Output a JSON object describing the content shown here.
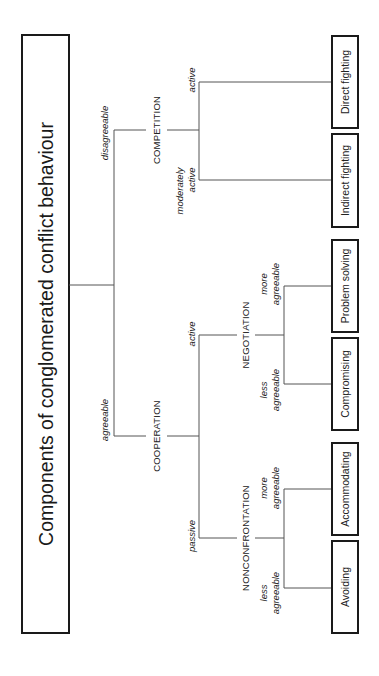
{
  "title": "Components of conglomerated conflict behaviour",
  "root": {
    "branches": [
      {
        "edge_label": "disagreeable",
        "node": "COMPETITION",
        "children": [
          {
            "edge_label": [
              "moderately",
              "active"
            ],
            "leaf": "Indirect fighting"
          },
          {
            "edge_label": [
              "active"
            ],
            "leaf": "Direct fighting"
          }
        ]
      },
      {
        "edge_label": "agreeable",
        "node": "COOPERATION",
        "children": [
          {
            "edge_label": "active",
            "node": "NEGOTIATION",
            "children": [
              {
                "edge_label": [
                  "less",
                  "agreeable"
                ],
                "leaf": "Compromising"
              },
              {
                "edge_label": [
                  "more",
                  "agreeable"
                ],
                "leaf": "Problem solving"
              }
            ]
          },
          {
            "edge_label": "passive",
            "node": "NONCONFRONTATION",
            "children": [
              {
                "edge_label": [
                  "less",
                  "agreeable"
                ],
                "leaf": "Avoiding"
              },
              {
                "edge_label": [
                  "more",
                  "agreeable"
                ],
                "leaf": "Accommodating"
              }
            ]
          }
        ]
      }
    ]
  },
  "colors": {
    "line": "#555555",
    "box_border": "#1a1a1a",
    "text": "#222222",
    "background": "#ffffff"
  }
}
